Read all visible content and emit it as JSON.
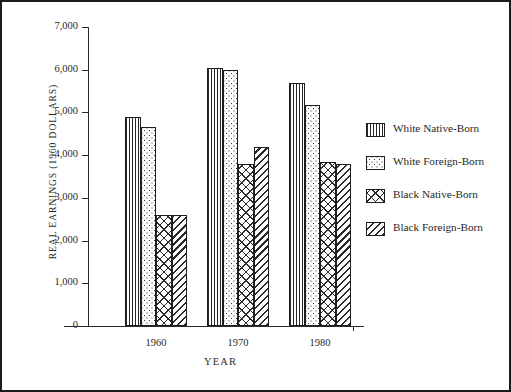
{
  "chart_data": {
    "type": "bar",
    "title": "",
    "xlabel": "YEAR",
    "ylabel": "REAL EARNINGS (1960 DOLLARS)",
    "categories": [
      "1960",
      "1970",
      "1980"
    ],
    "ylim": [
      0,
      7000
    ],
    "yticks": [
      "0",
      "1,000",
      "2,000",
      "3,000",
      "4,000",
      "5,000",
      "6,000",
      "7,000"
    ],
    "ytick_values": [
      0,
      1000,
      2000,
      3000,
      4000,
      5000,
      6000,
      7000
    ],
    "grid": false,
    "legend_position": "right",
    "series": [
      {
        "name": "White Native-Born",
        "pattern": "vertical-lines",
        "values": [
          4900,
          6050,
          5680
        ]
      },
      {
        "name": "White Foreign-Born",
        "pattern": "dots",
        "values": [
          4670,
          6000,
          5180
        ]
      },
      {
        "name": "Black Native-Born",
        "pattern": "cross-hatch",
        "values": [
          2600,
          3800,
          3850
        ]
      },
      {
        "name": "Black Foreign-Born",
        "pattern": "diagonal-hatch",
        "values": [
          2600,
          4180,
          3800
        ]
      }
    ]
  },
  "legend": {
    "items": [
      {
        "label": "White Native-Born"
      },
      {
        "label": "White Foreign-Born"
      },
      {
        "label": "Black Native-Born"
      },
      {
        "label": "Black Foreign-Born"
      }
    ]
  }
}
